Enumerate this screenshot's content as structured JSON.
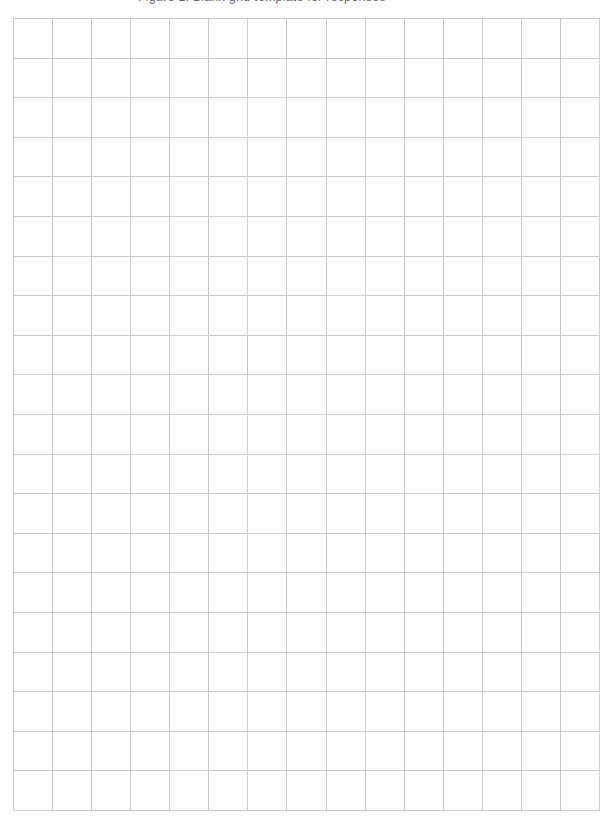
{
  "document": {
    "kind": "grid-paper-sheet",
    "page_background_color": "#ffffff",
    "content_summary": "Blank squared / graph paper sheet with no written content"
  },
  "clipped_caption": {
    "text": "Figure 1: Blank grid template for responses"
  },
  "grid": {
    "columns": 15,
    "rows": 20,
    "total_cells": 300,
    "line_color": "#c9c9c9",
    "cell_fill_color": "#ffffff",
    "line_width_px": 1,
    "left_px": 13,
    "top_px": 18,
    "width_px": 587,
    "height_px": 793,
    "cell_width_px": 39.1,
    "cell_height_px": 39.6,
    "cells": []
  }
}
